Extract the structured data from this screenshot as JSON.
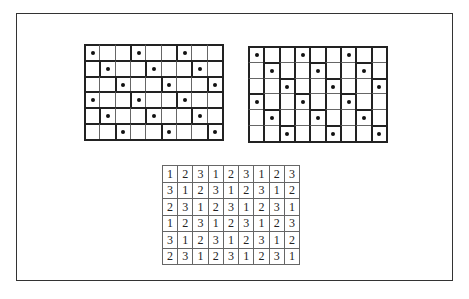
{
  "figure": {
    "left_grid": {
      "description": "horizontal 1x3 tiling",
      "rows": 6,
      "cols": 9,
      "dots": [
        [
          0,
          3,
          6
        ],
        [
          1,
          4,
          7
        ],
        [
          2,
          5,
          8
        ],
        [
          0,
          3,
          6
        ],
        [
          1,
          4,
          7
        ],
        [
          2,
          5,
          8
        ]
      ]
    },
    "right_grid": {
      "description": "vertical 3x1 tiling",
      "rows": 6,
      "cols": 9,
      "dots": [
        [
          0,
          3,
          6
        ],
        [
          1,
          4,
          7
        ],
        [
          2,
          5,
          8
        ],
        [
          0,
          3,
          6
        ],
        [
          1,
          4,
          7
        ],
        [
          2,
          5,
          8
        ]
      ]
    },
    "number_table": {
      "rows": [
        [
          "1",
          "2",
          "3",
          "1",
          "2",
          "3",
          "1",
          "2",
          "3"
        ],
        [
          "3",
          "1",
          "2",
          "3",
          "1",
          "2",
          "3",
          "1",
          "2"
        ],
        [
          "2",
          "3",
          "1",
          "2",
          "3",
          "1",
          "2",
          "3",
          "1"
        ],
        [
          "1",
          "2",
          "3",
          "1",
          "2",
          "3",
          "1",
          "2",
          "3"
        ],
        [
          "3",
          "1",
          "2",
          "3",
          "1",
          "2",
          "3",
          "1",
          "2"
        ],
        [
          "2",
          "3",
          "1",
          "2",
          "3",
          "1",
          "2",
          "3",
          "1"
        ]
      ]
    }
  }
}
